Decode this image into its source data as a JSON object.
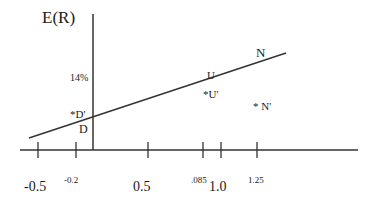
{
  "diagram": {
    "y_axis_label": "E(R)",
    "y_tick_label": "14%",
    "line_points": [
      {
        "label": "D",
        "description": "point on line near y-axis"
      },
      {
        "label": "U",
        "description": "point on line"
      },
      {
        "label": "N",
        "description": "point near line end"
      }
    ],
    "off_line_points": [
      {
        "label": "*D'"
      },
      {
        "label": "*U'"
      },
      {
        "label": "* N'"
      }
    ],
    "x_tick_labels": [
      "-0.5",
      "-0.2",
      "0.5",
      ".085",
      "1.0",
      "1.25"
    ]
  }
}
